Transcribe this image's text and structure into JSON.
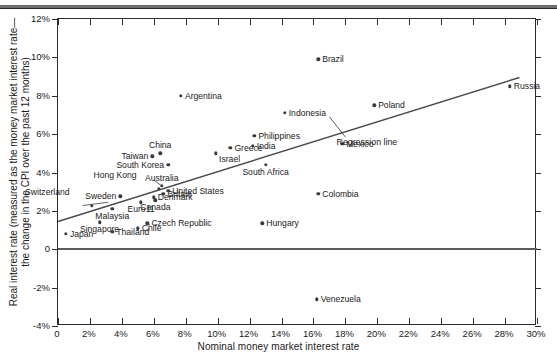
{
  "chart_data": {
    "type": "scatter",
    "title": "",
    "xlabel": "Nominal money market interest rate",
    "ylabel": "Real interest rate (measured as the money market interest rate— the change in the CPI over the past 12 months)",
    "ylabel_line1": "Real interest rate (measured as the money market interest rate—",
    "ylabel_line2": "the change in the CPI over the past 12 months)",
    "xlim": [
      0,
      30
    ],
    "ylim": [
      -4,
      12
    ],
    "xticks": [
      "0",
      "2%",
      "4%",
      "6%",
      "8%",
      "10%",
      "12%",
      "14%",
      "16%",
      "18%",
      "20%",
      "22%",
      "24%",
      "26%",
      "28%",
      "30%"
    ],
    "xtick_values": [
      0,
      2,
      4,
      6,
      8,
      10,
      12,
      14,
      16,
      18,
      20,
      22,
      24,
      26,
      28,
      30
    ],
    "yticks": [
      "12%",
      "10%",
      "8%",
      "6%",
      "4%",
      "2%",
      "0",
      "-2%",
      "-4%"
    ],
    "ytick_values": [
      12,
      10,
      8,
      6,
      4,
      2,
      0,
      -2,
      -4
    ],
    "grid": false,
    "legend": null,
    "zero_line": 0,
    "annotations": [
      {
        "name": "regression-line-label",
        "text": "Regression line",
        "x": 19.2,
        "y": 5.6
      }
    ],
    "regression_line": {
      "name": "Regression line",
      "x_start": 0.0,
      "y_start": 1.45,
      "x_end": 28.9,
      "y_end": 8.95
    },
    "points": [
      {
        "label": "Japan",
        "x": 0.5,
        "y": 0.8,
        "align": "right"
      },
      {
        "label": "Switzerland",
        "x": 2.1,
        "y": 2.25,
        "align": "leader-left"
      },
      {
        "label": "Singapore",
        "x": 2.6,
        "y": 1.4,
        "align": "below"
      },
      {
        "label": "Sweden",
        "x": 3.9,
        "y": 2.75,
        "align": "left"
      },
      {
        "label": "Malaysia",
        "x": 3.4,
        "y": 2.1,
        "align": "below"
      },
      {
        "label": "Thailand",
        "x": 3.4,
        "y": 0.9,
        "align": "right"
      },
      {
        "label": "Chile",
        "x": 5.0,
        "y": 1.1,
        "align": "right"
      },
      {
        "label": "Euro11",
        "x": 5.2,
        "y": 2.45,
        "align": "below"
      },
      {
        "label": "Taiwan",
        "x": 5.9,
        "y": 4.85,
        "align": "left"
      },
      {
        "label": "Czech Republic",
        "x": 5.6,
        "y": 1.35,
        "align": "right"
      },
      {
        "label": "China",
        "x": 6.4,
        "y": 5.0,
        "align": "above"
      },
      {
        "label": "Hong Kong",
        "x": 6.3,
        "y": 3.15,
        "align": "leader-left"
      },
      {
        "label": "Denmark",
        "x": 6.0,
        "y": 2.7,
        "align": "right"
      },
      {
        "label": "Canada",
        "x": 6.1,
        "y": 2.55,
        "align": "below"
      },
      {
        "label": "Australia",
        "x": 6.5,
        "y": 3.3,
        "align": "above"
      },
      {
        "label": "Britain",
        "x": 6.6,
        "y": 2.9,
        "align": "right"
      },
      {
        "label": "United States",
        "x": 6.9,
        "y": 3.05,
        "align": "right"
      },
      {
        "label": "South Korea",
        "x": 6.9,
        "y": 4.4,
        "align": "left"
      },
      {
        "label": "Argentina",
        "x": 7.7,
        "y": 8.0,
        "align": "right"
      },
      {
        "label": "Israel",
        "x": 9.9,
        "y": 5.0,
        "align": "belowright"
      },
      {
        "label": "Greece",
        "x": 10.8,
        "y": 5.3,
        "align": "right"
      },
      {
        "label": "India",
        "x": 12.2,
        "y": 5.4,
        "align": "right"
      },
      {
        "label": "Philippines",
        "x": 12.3,
        "y": 5.9,
        "align": "right"
      },
      {
        "label": "South Africa",
        "x": 13.0,
        "y": 4.4,
        "align": "below"
      },
      {
        "label": "Hungary",
        "x": 12.8,
        "y": 1.35,
        "align": "right"
      },
      {
        "label": "Indonesia",
        "x": 14.2,
        "y": 7.1,
        "align": "right"
      },
      {
        "label": "Brazil",
        "x": 16.3,
        "y": 9.9,
        "align": "right"
      },
      {
        "label": "Colombia",
        "x": 16.3,
        "y": 2.9,
        "align": "right"
      },
      {
        "label": "Venezuela",
        "x": 16.2,
        "y": -2.6,
        "align": "right"
      },
      {
        "label": "Mexico",
        "x": 17.8,
        "y": 5.5,
        "align": "right"
      },
      {
        "label": "Poland",
        "x": 19.8,
        "y": 7.5,
        "align": "right"
      },
      {
        "label": "Russia",
        "x": 28.3,
        "y": 8.5,
        "align": "right"
      }
    ],
    "colors": {
      "point": "#3a3a3a",
      "line": "#4a4a4a",
      "axis": "#2b2b2b",
      "zero": "#5a5a5a",
      "background": "#ffffff"
    }
  }
}
